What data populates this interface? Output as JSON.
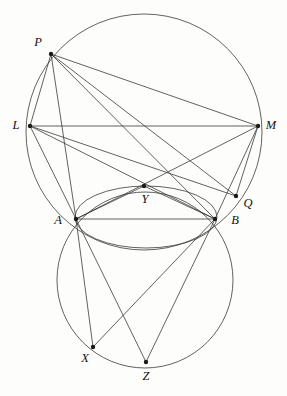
{
  "figure": {
    "background_color": "#fdfdfc",
    "stroke_color": "#3a3a3a",
    "dot_color": "#1a1a1a",
    "label_color": "#111111"
  },
  "points": [
    {
      "id": "P",
      "label": "P",
      "x": 51,
      "y": 54,
      "lx": 38,
      "ly": 43
    },
    {
      "id": "L",
      "label": "L",
      "x": 30,
      "y": 126,
      "lx": 16,
      "ly": 126
    },
    {
      "id": "M",
      "label": "M",
      "x": 258,
      "y": 126,
      "lx": 271,
      "ly": 126
    },
    {
      "id": "Y",
      "label": "Y",
      "x": 144,
      "y": 186,
      "lx": 145,
      "ly": 200
    },
    {
      "id": "Q",
      "label": "Q",
      "x": 236,
      "y": 196,
      "lx": 248,
      "ly": 204
    },
    {
      "id": "A",
      "label": "A",
      "x": 76,
      "y": 219,
      "lx": 58,
      "ly": 221
    },
    {
      "id": "B",
      "label": "B",
      "x": 215,
      "y": 219,
      "lx": 235,
      "ly": 221
    },
    {
      "id": "X",
      "label": "X",
      "x": 93,
      "y": 347,
      "lx": 85,
      "ly": 359
    },
    {
      "id": "Z",
      "label": "Z",
      "x": 146,
      "y": 362,
      "lx": 146,
      "ly": 377
    }
  ],
  "circles": [
    {
      "id": "big-circle",
      "name": "circumcircle-PLMB",
      "cx": 144,
      "cy": 132,
      "r": 118
    },
    {
      "id": "middle-circle",
      "name": "circle-AYB",
      "cx": 146,
      "cy": 217,
      "r": 71,
      "ry": 31
    },
    {
      "id": "bottom-circle",
      "name": "circle-AXZB",
      "cx": 145,
      "cy": 280,
      "r": 88
    }
  ],
  "segments": [
    {
      "name": "segment-P-L",
      "from": "P",
      "to": "L"
    },
    {
      "name": "segment-P-M",
      "from": "P",
      "to": "M"
    },
    {
      "name": "segment-P-A",
      "from": "P",
      "to": "A"
    },
    {
      "name": "segment-P-B",
      "from": "P",
      "to": "B"
    },
    {
      "name": "segment-P-Q",
      "from": "P",
      "to": "Q"
    },
    {
      "name": "segment-L-M",
      "from": "L",
      "to": "M"
    },
    {
      "name": "segment-L-A",
      "from": "L",
      "to": "A"
    },
    {
      "name": "segment-L-B",
      "from": "L",
      "to": "B"
    },
    {
      "name": "segment-L-Q",
      "from": "L",
      "to": "Q"
    },
    {
      "name": "segment-M-A",
      "from": "M",
      "to": "A"
    },
    {
      "name": "segment-M-B",
      "from": "M",
      "to": "B"
    },
    {
      "name": "segment-M-Q",
      "from": "M",
      "to": "Q"
    },
    {
      "name": "segment-A-B",
      "from": "A",
      "to": "B"
    },
    {
      "name": "segment-A-Y",
      "from": "A",
      "to": "Y"
    },
    {
      "name": "segment-B-Y",
      "from": "B",
      "to": "Y"
    },
    {
      "name": "segment-A-X",
      "from": "A",
      "to": "X"
    },
    {
      "name": "segment-A-Z",
      "from": "A",
      "to": "Z"
    },
    {
      "name": "segment-B-X",
      "from": "B",
      "to": "X"
    },
    {
      "name": "segment-B-Z",
      "from": "B",
      "to": "Z"
    }
  ]
}
